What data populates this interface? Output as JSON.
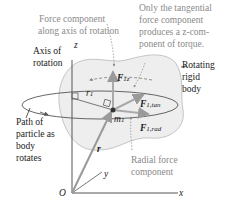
{
  "diagram": {
    "annotations": {
      "force_axis": [
        "Force component",
        "along axis of rotation"
      ],
      "tangential_note": [
        "Only the tangential",
        "force component",
        "produces a z-com-",
        "ponent of torque."
      ],
      "axis_of_rotation": [
        "Axis of",
        "rotation"
      ],
      "rotating_body": [
        "Rotating",
        "rigid",
        "body"
      ],
      "path": [
        "Path of",
        "particle as",
        "body",
        "rotates"
      ],
      "radial": [
        "Radial force",
        "component"
      ]
    },
    "symbols": {
      "z": "z",
      "y": "y",
      "x": "x",
      "origin": "O",
      "r1": "r",
      "r1_sub": "1",
      "m1": "m",
      "m1_sub": "1",
      "F1z": "F",
      "F1z_sub": "1z",
      "F1tan": "F",
      "F1tan_sub": "1,tan",
      "F1rad": "F",
      "F1rad_sub": "1,rad",
      "r_vec": "r"
    },
    "colors": {
      "body_fill": "#eeeeee",
      "body_stroke": "#b8b8b8",
      "force_arrow": "#9a9a9a",
      "axis": "#555555",
      "annotation_gray": "#8a8a8a",
      "text": "#1a1a1a"
    }
  }
}
